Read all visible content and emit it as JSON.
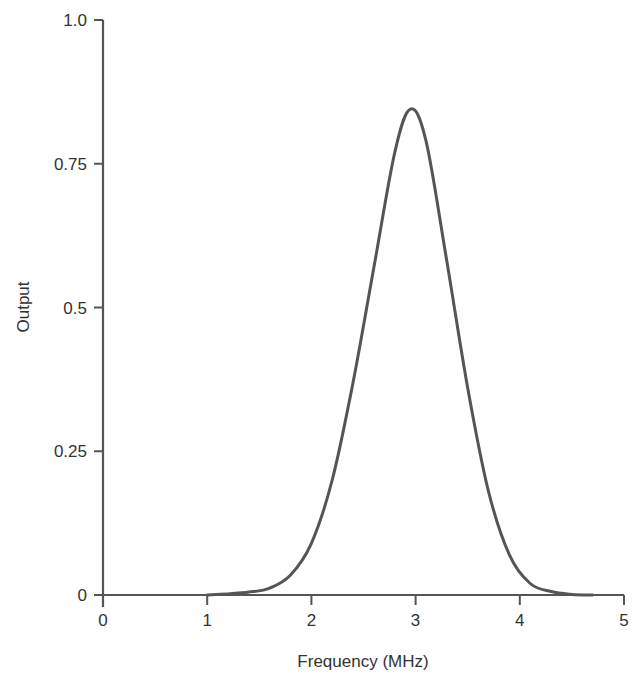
{
  "chart_data": {
    "type": "line",
    "title": "",
    "xlabel": "Frequency (MHz)",
    "ylabel": "Output",
    "xlim": [
      0,
      5
    ],
    "ylim": [
      0,
      1.0
    ],
    "xticks": [
      "0",
      "1",
      "2",
      "3",
      "4",
      "5"
    ],
    "xtick_values": [
      0,
      1,
      2,
      3,
      4,
      5
    ],
    "yticks": [
      "0",
      "0.25",
      "0.5",
      "0.75",
      "1.0"
    ],
    "ytick_values": [
      0,
      0.25,
      0.5,
      0.75,
      1.0
    ],
    "grid": false,
    "legend": null,
    "series": [
      {
        "name": "Output",
        "color": "#555555",
        "x": [
          1.0,
          1.2,
          1.4,
          1.6,
          1.8,
          2.0,
          2.2,
          2.4,
          2.6,
          2.8,
          2.95,
          3.1,
          3.3,
          3.5,
          3.7,
          3.9,
          4.1,
          4.3,
          4.5,
          4.7
        ],
        "y": [
          0.0,
          0.002,
          0.005,
          0.012,
          0.035,
          0.09,
          0.2,
          0.37,
          0.57,
          0.77,
          0.845,
          0.79,
          0.58,
          0.36,
          0.18,
          0.07,
          0.02,
          0.006,
          0.001,
          0.0
        ]
      }
    ],
    "peak": {
      "x": 2.95,
      "y": 0.845
    }
  }
}
